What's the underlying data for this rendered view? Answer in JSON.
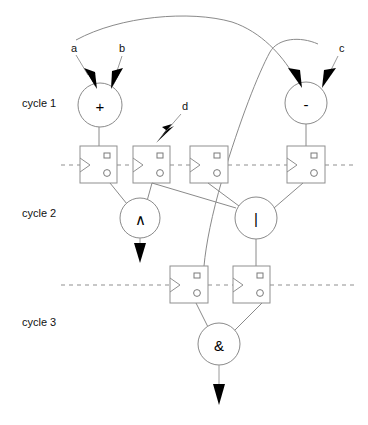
{
  "diagram": {
    "type": "circuit-pipeline-diagram",
    "width": 368,
    "height": 425,
    "background_color": "#ffffff",
    "wire_color": "#8a8a8a",
    "arrow_color": "#000000",
    "text_color": "#111111"
  },
  "cycle_labels": [
    {
      "id": "cycle-1",
      "text": "cycle 1",
      "x": 22,
      "y": 107
    },
    {
      "id": "cycle-2",
      "text": "cycle 2",
      "x": 22,
      "y": 217
    },
    {
      "id": "cycle-3",
      "text": "cycle 3",
      "x": 22,
      "y": 326
    }
  ],
  "signal_labels": [
    {
      "id": "input-a",
      "text": "a",
      "x": 71,
      "y": 52
    },
    {
      "id": "input-b",
      "text": "b",
      "x": 119,
      "y": 52
    },
    {
      "id": "input-c",
      "text": "c",
      "x": 339,
      "y": 52
    },
    {
      "id": "input-d",
      "text": "d",
      "x": 182,
      "y": 110
    }
  ],
  "operators": [
    {
      "id": "op-add",
      "glyph": "+",
      "cycle": "cycle 1",
      "cx": 100,
      "cy": 105,
      "r": 22
    },
    {
      "id": "op-sub",
      "glyph": "-",
      "cycle": "cycle 1",
      "cx": 306,
      "cy": 103,
      "r": 21
    },
    {
      "id": "op-xor",
      "glyph": "∧",
      "cycle": "cycle 2",
      "cx": 140,
      "cy": 218,
      "r": 20
    },
    {
      "id": "op-or",
      "glyph": "|",
      "cycle": "cycle 2",
      "cx": 256,
      "cy": 218,
      "r": 21
    },
    {
      "id": "op-and",
      "glyph": "&",
      "cycle": "cycle 3",
      "cx": 219,
      "cy": 344,
      "r": 21
    }
  ],
  "registers_row1": [
    {
      "id": "ff-1",
      "x": 80,
      "y": 146,
      "w": 37,
      "h": 37
    },
    {
      "id": "ff-2",
      "x": 133,
      "y": 146,
      "w": 37,
      "h": 37
    },
    {
      "id": "ff-3",
      "x": 190,
      "y": 146,
      "w": 38,
      "h": 37
    },
    {
      "id": "ff-4",
      "x": 287,
      "y": 146,
      "w": 38,
      "h": 37
    }
  ],
  "registers_row2": [
    {
      "id": "ff-5",
      "x": 170,
      "y": 266,
      "w": 38,
      "h": 37
    },
    {
      "id": "ff-6",
      "x": 233,
      "y": 266,
      "w": 37,
      "h": 37
    }
  ],
  "clock_lines": [
    {
      "id": "clock-line-1",
      "y": 165,
      "x1": 61,
      "x2": 368
    },
    {
      "id": "clock-line-2",
      "y": 285,
      "x1": 61,
      "x2": 368
    }
  ],
  "output_arrows": [
    {
      "id": "output-xor",
      "from_x": 140,
      "from_y": 238,
      "to_x": 140,
      "to_y": 262
    },
    {
      "id": "output-and",
      "from_x": 219,
      "from_y": 365,
      "to_x": 219,
      "to_y": 404
    }
  ]
}
